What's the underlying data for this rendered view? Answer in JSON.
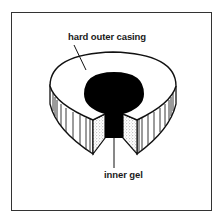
{
  "diagram": {
    "type": "labeled-illustration",
    "labels": {
      "outer": "hard outer casing",
      "inner": "inner gel"
    },
    "colors": {
      "frame": "#333333",
      "outline": "#111111",
      "casing_fill": "#ffffff",
      "gel_fill": "#000000",
      "cut_face_stipple": "#888888"
    }
  }
}
